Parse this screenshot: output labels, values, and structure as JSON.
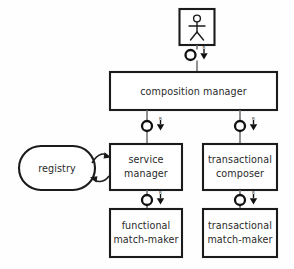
{
  "diagram": {
    "type": "uml-component-diagram",
    "background_color": "#fefefe",
    "line_color": "#1b1b1b",
    "connector_color": "#6d6d6d",
    "text_color": "#2a2a2a"
  },
  "actor": {
    "name": "user-actor",
    "label": ""
  },
  "nodes": {
    "composition_manager": {
      "label": "composition manager",
      "lines": [
        "composition manager"
      ]
    },
    "service_manager": {
      "label": "service manager",
      "lines": [
        "service",
        "manager"
      ]
    },
    "transactional_composer": {
      "label": "transactional composer",
      "lines": [
        "transactional",
        "composer"
      ]
    },
    "registry": {
      "label": "registry",
      "lines": [
        "registry"
      ]
    },
    "functional_match_maker": {
      "label": "functional match-maker",
      "lines": [
        "functional",
        "match-maker"
      ]
    },
    "transactional_match_maker": {
      "label": "transactional match-maker",
      "lines": [
        "transactional",
        "match-maker"
      ]
    }
  },
  "connectors": [
    {
      "name": "connector-actor-to-composition-manager",
      "from": "user-actor",
      "to": "composition manager",
      "required_label": "R",
      "icon": "ball-and-socket-icon"
    },
    {
      "name": "connector-composition-manager-to-service-manager",
      "from": "composition manager",
      "to": "service manager",
      "required_label": "R",
      "icon": "ball-and-socket-icon"
    },
    {
      "name": "connector-composition-manager-to-transactional-composer",
      "from": "composition manager",
      "to": "transactional composer",
      "required_label": "R",
      "icon": "ball-and-socket-icon"
    },
    {
      "name": "connector-service-manager-to-functional-match-maker",
      "from": "service manager",
      "to": "functional match-maker",
      "required_label": "R",
      "icon": "ball-and-socket-icon"
    },
    {
      "name": "connector-transactional-composer-to-transactional-match-maker",
      "from": "transactional composer",
      "to": "transactional match-maker",
      "required_label": "R",
      "icon": "ball-and-socket-icon"
    },
    {
      "name": "association-registry-service-manager",
      "from": "registry",
      "to": "service manager",
      "required_label": "",
      "icon": "bidirectional-arrow-icon"
    }
  ]
}
